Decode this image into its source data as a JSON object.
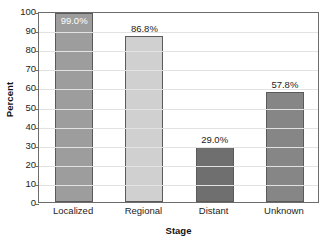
{
  "chart_data": {
    "type": "bar",
    "title": "",
    "xlabel": "Stage",
    "ylabel": "Percent",
    "categories": [
      "Localized",
      "Regional",
      "Distant",
      "Unknown"
    ],
    "values": [
      99.0,
      86.8,
      29.0,
      57.8
    ],
    "data_labels": [
      "99.0%",
      "86.8%",
      "29.0%",
      "57.8%"
    ],
    "label_placement": [
      "inside",
      "above",
      "above",
      "above"
    ],
    "bar_colors": [
      "#9d9d9d",
      "#d0d0d0",
      "#6f6f6f",
      "#868686"
    ],
    "bar_border_color": "#5a5a5a",
    "ylim": [
      0,
      100
    ],
    "ytick_step": 10,
    "ytick_labels": [
      "0",
      "10",
      "20",
      "30",
      "40",
      "50",
      "60",
      "70",
      "80",
      "90",
      "100"
    ],
    "grid": true,
    "grid_color": "#e2e2e2",
    "legend": "none",
    "axis_color": "#6d6d6d",
    "background": "#ffffff"
  }
}
